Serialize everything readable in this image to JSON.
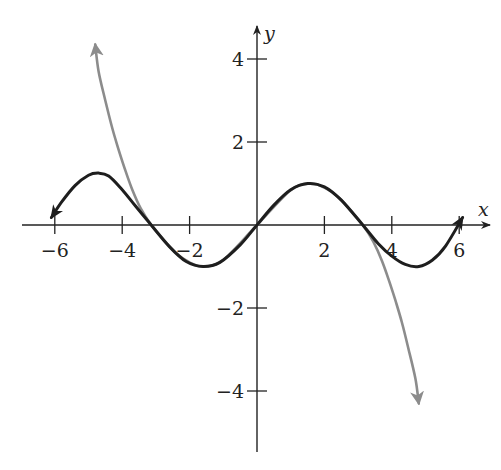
{
  "chart_data": {
    "type": "line",
    "title": "",
    "xlabel": "x",
    "ylabel": "y",
    "xlim": [
      -6.3,
      6.9
    ],
    "ylim": [
      -5.4,
      4.9
    ],
    "grid": false,
    "legend": null,
    "x_ticks": [
      -6,
      -4,
      -2,
      2,
      4,
      6
    ],
    "x_tick_labels": [
      "−6",
      "−4",
      "−2",
      "2",
      "4",
      "6"
    ],
    "y_ticks": [
      -4,
      -2,
      2,
      4
    ],
    "y_tick_labels": [
      "−4",
      "−2",
      "2",
      "4"
    ],
    "series": [
      {
        "name": "dark-curve",
        "color": "#1e1e1e",
        "arrows": "both",
        "x": [
          -6.1,
          -5.8,
          -5.4,
          -5.0,
          -4.7,
          -4.4,
          -4.0,
          -3.6,
          -3.14,
          -2.6,
          -2.1,
          -1.6,
          -1.1,
          -0.5,
          0,
          0.5,
          1.0,
          1.5,
          2.0,
          2.5,
          3.14,
          3.6,
          4.0,
          4.4,
          4.8,
          5.2,
          5.6,
          6.1
        ],
        "y": [
          0.18,
          0.55,
          0.95,
          1.2,
          1.25,
          1.18,
          0.85,
          0.45,
          0.0,
          -0.52,
          -0.88,
          -1.0,
          -0.9,
          -0.48,
          0.0,
          0.48,
          0.85,
          1.0,
          0.92,
          0.6,
          0.0,
          -0.45,
          -0.75,
          -0.95,
          -1.0,
          -0.85,
          -0.5,
          0.18
        ]
      },
      {
        "name": "gray-curve",
        "color": "#8c8c8c",
        "arrows": "both",
        "x": [
          -4.8,
          -4.7,
          -4.5,
          -4.3,
          -4.1,
          -3.9,
          -3.7,
          -3.45,
          -3.14,
          -2.8,
          -2.4,
          -2.0,
          -1.6,
          -1.0,
          0,
          1.0,
          1.6,
          2.0,
          2.4,
          2.8,
          3.14,
          3.45,
          3.7,
          3.9,
          4.1,
          4.3,
          4.5,
          4.7,
          4.8
        ],
        "y": [
          4.35,
          3.7,
          3.0,
          2.35,
          1.8,
          1.3,
          0.85,
          0.4,
          0.0,
          -0.33,
          -0.68,
          -0.9,
          -1.0,
          -0.84,
          0.0,
          0.84,
          1.0,
          0.9,
          0.68,
          0.33,
          0.0,
          -0.4,
          -0.85,
          -1.3,
          -1.8,
          -2.35,
          -3.0,
          -3.7,
          -4.3
        ]
      }
    ]
  },
  "axes": {
    "x_name": "x",
    "y_name": "y"
  }
}
